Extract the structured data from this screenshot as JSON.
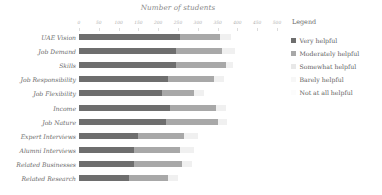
{
  "chart_data": {
    "type": "bar",
    "orientation": "horizontal",
    "stacked": true,
    "title": "Number of students",
    "xlabel": "",
    "ylabel": "",
    "xlim": [
      0,
      500
    ],
    "xticks": [
      0,
      50,
      100,
      150,
      200,
      250,
      300,
      350,
      400,
      450,
      500
    ],
    "xtick_labels": [
      "0",
      "50",
      "100",
      "150",
      "200",
      "250",
      "300",
      "350",
      "400",
      "450",
      "500"
    ],
    "grid": false,
    "legend_position": "right",
    "legend_title": "Legend",
    "categories": [
      "UAE Vision",
      "Job Demand",
      "Skills",
      "Job Responsibility",
      "Job Flexibility",
      "Income",
      "Job Nature",
      "Expert Interviews",
      "Alumni Interviews",
      "Related Businesses",
      "Related Research"
    ],
    "series": [
      {
        "name": "Very helpful",
        "color": "#6e6e6e",
        "values": [
          255,
          245,
          245,
          225,
          210,
          230,
          220,
          150,
          140,
          140,
          125
        ]
      },
      {
        "name": "Moderately helpful",
        "color": "#a8a8a8",
        "values": [
          100,
          115,
          125,
          115,
          80,
          115,
          130,
          115,
          115,
          120,
          100
        ]
      },
      {
        "name": "Somewhat helpful",
        "color": "#f0f0f0",
        "values": [
          30,
          35,
          20,
          25,
          25,
          25,
          25,
          35,
          35,
          25,
          25
        ]
      },
      {
        "name": "Barely helpful",
        "color": "#fafafa",
        "values": [
          0,
          0,
          0,
          0,
          0,
          0,
          0,
          0,
          0,
          0,
          0
        ]
      },
      {
        "name": "Not at all helpful",
        "color": "#fdfdfd",
        "values": [
          0,
          0,
          0,
          0,
          0,
          0,
          0,
          0,
          0,
          0,
          0
        ]
      }
    ]
  },
  "legend": {
    "title": "Legend",
    "items": [
      {
        "label": "Very helpful",
        "color": "#6e6e6e"
      },
      {
        "label": "Moderately helpful",
        "color": "#a8a8a8"
      },
      {
        "label": "Somewhat helpful",
        "color": "#e8e8e8"
      },
      {
        "label": "Barely helpful",
        "color": "#f7f7f7"
      },
      {
        "label": "Not at all helpful",
        "color": "#fcfcfc"
      }
    ]
  }
}
